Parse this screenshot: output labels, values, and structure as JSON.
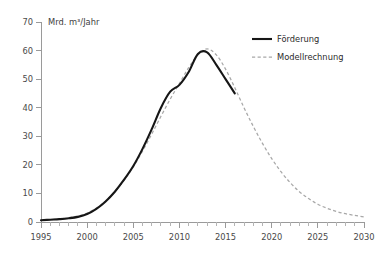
{
  "chart_data": {
    "type": "line",
    "title": "",
    "xlabel": "",
    "ylabel": "Mrd. m³/Jahr",
    "unit_label": "Mrd. m³/Jahr",
    "xlim": [
      1995,
      2030
    ],
    "ylim": [
      0,
      70
    ],
    "grid": false,
    "legend_position": "top-right",
    "x_tick_labels": [
      "1995",
      "2000",
      "2005",
      "2010",
      "2015",
      "2020",
      "2025",
      "2030"
    ],
    "x_ticks": [
      1995,
      2000,
      2005,
      2010,
      2015,
      2020,
      2025,
      2030
    ],
    "x_minor_tick_step": 1,
    "y_tick_labels": [
      "0",
      "10",
      "20",
      "30",
      "40",
      "50",
      "60",
      "70"
    ],
    "y_ticks": [
      0,
      10,
      20,
      30,
      40,
      50,
      60,
      70
    ],
    "colors": {
      "series_solid": "#161616",
      "series_dashed": "#a8a8a8",
      "axis": "#9a9a9a",
      "text": "#3a3a3a",
      "background": "#ffffff"
    },
    "series": [
      {
        "name": "Förderung",
        "style": "solid",
        "color": "#161616",
        "x": [
          1995,
          1996,
          1997,
          1998,
          1999,
          2000,
          2001,
          2002,
          2003,
          2004,
          2005,
          2006,
          2007,
          2008,
          2009,
          2010,
          2011,
          2012,
          2013,
          2014,
          2015,
          2016
        ],
        "values": [
          0.6,
          0.8,
          1.0,
          1.3,
          1.8,
          2.8,
          4.6,
          7.2,
          10.6,
          14.8,
          19.6,
          25.6,
          32.5,
          40.0,
          45.6,
          48.0,
          52.5,
          58.8,
          59.4,
          55.0,
          50.0,
          45.0
        ]
      },
      {
        "name": "Modellrechnung",
        "style": "dashed",
        "color": "#a8a8a8",
        "x": [
          1995,
          1996,
          1997,
          1998,
          1999,
          2000,
          2001,
          2002,
          2003,
          2004,
          2005,
          2006,
          2007,
          2008,
          2009,
          2010,
          2011,
          2012,
          2013,
          2014,
          2015,
          2016,
          2017,
          2018,
          2019,
          2020,
          2021,
          2022,
          2023,
          2024,
          2025,
          2026,
          2027,
          2028,
          2029,
          2030
        ],
        "values": [
          0.6,
          0.8,
          1.1,
          1.5,
          2.1,
          3.1,
          4.9,
          7.4,
          10.6,
          14.6,
          19.3,
          24.8,
          30.8,
          37.0,
          43.0,
          48.5,
          54.0,
          58.5,
          60.6,
          58.5,
          53.5,
          47.0,
          40.0,
          33.5,
          27.5,
          22.2,
          17.6,
          13.8,
          10.6,
          8.2,
          6.2,
          4.8,
          3.7,
          2.9,
          2.3,
          1.8
        ]
      }
    ]
  },
  "legend": {
    "entries": [
      {
        "label": "Förderung",
        "style": "solid",
        "color": "#161616"
      },
      {
        "label": "Modellrechnung",
        "style": "dashed",
        "color": "#a8a8a8"
      }
    ]
  },
  "axes": {
    "y_unit_label": "Mrd. m³/Jahr"
  }
}
